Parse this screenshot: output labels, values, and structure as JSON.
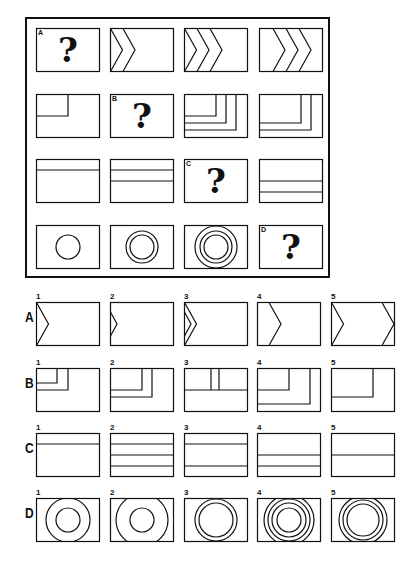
{
  "puzzle": {
    "question_mark": "?",
    "rows": [
      {
        "label": "A",
        "cells": [
          "question",
          "chevron-1",
          "chevron-2",
          "chevron-3-shifted"
        ]
      },
      {
        "label": "B",
        "cells": [
          "corner-1",
          "question",
          "corner-3",
          "corner-2-shifted"
        ]
      },
      {
        "label": "C",
        "cells": [
          "hline-1-top",
          "hline-2-top",
          "question",
          "hline-2-bottom"
        ]
      },
      {
        "label": "D",
        "cells": [
          "circle-1",
          "circle-2",
          "circle-3",
          "question"
        ]
      }
    ]
  },
  "answers": {
    "rows": [
      {
        "label": "A",
        "options": [
          "1",
          "2",
          "3",
          "4",
          "5"
        ]
      },
      {
        "label": "B",
        "options": [
          "1",
          "2",
          "3",
          "4",
          "5"
        ]
      },
      {
        "label": "C",
        "options": [
          "1",
          "2",
          "3",
          "4",
          "5"
        ]
      },
      {
        "label": "D",
        "options": [
          "1",
          "2",
          "3",
          "4",
          "5"
        ]
      }
    ]
  },
  "colors": {
    "stroke": "#111111",
    "background": "#ffffff"
  }
}
